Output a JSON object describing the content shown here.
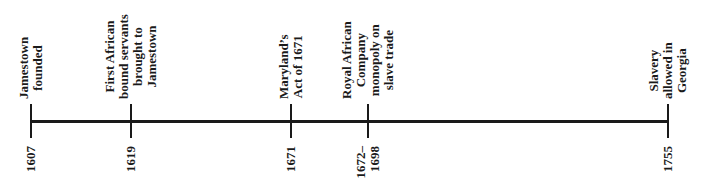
{
  "timeline": {
    "axis": {
      "start_x": 31,
      "end_x": 669,
      "color": "#1a1a1a"
    },
    "events": [
      {
        "x": 31,
        "year_lines": [
          "1607"
        ],
        "label_lines": [
          "Jamestown",
          "founded"
        ]
      },
      {
        "x": 131,
        "year_lines": [
          "1619"
        ],
        "label_lines": [
          "First African",
          "bound servants",
          "brought to",
          "Jamestown"
        ]
      },
      {
        "x": 291,
        "year_lines": [
          "1671"
        ],
        "label_lines": [
          "Maryland’s",
          "Act of 1671"
        ]
      },
      {
        "x": 368,
        "year_lines": [
          "1672–",
          "1698"
        ],
        "label_lines": [
          "Royal African",
          "Company",
          "monopoly on",
          "slave trade"
        ]
      },
      {
        "x": 668,
        "year_lines": [
          "1755"
        ],
        "label_lines": [
          "Slavery",
          "allowed in",
          "Georgia"
        ]
      }
    ]
  }
}
